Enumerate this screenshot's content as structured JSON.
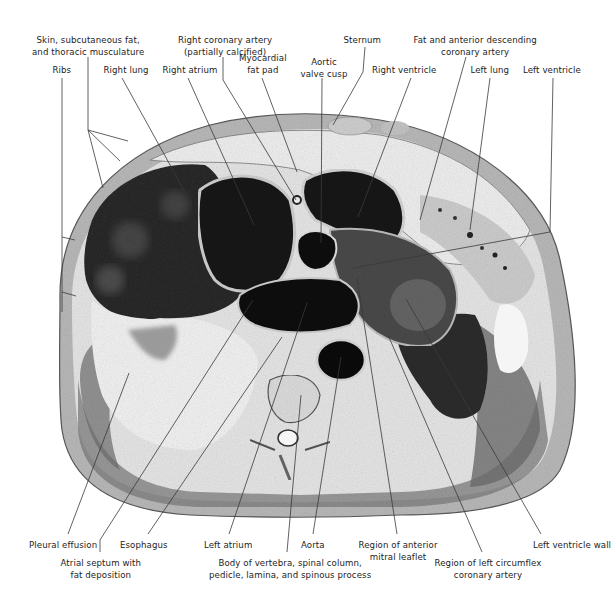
{
  "figure": {
    "type": "anatomical cross-section",
    "colors": {
      "ink": "#1d1d1d",
      "tissue_dark": "#141414",
      "tissue_mid": "#6d6d6d",
      "tissue_light": "#d9d9d9",
      "background": "#ffffff"
    }
  },
  "labels": {
    "top": [
      {
        "id": "skin",
        "lines": [
          "Skin, subcutaneous fat,",
          "and thoracic musculature"
        ],
        "x": 88,
        "y": 35
      },
      {
        "id": "right-coronary",
        "lines": [
          "Right coronary artery",
          "(partially calcified)"
        ],
        "x": 225,
        "y": 35
      },
      {
        "id": "sternum",
        "lines": [
          "Sternum"
        ],
        "x": 362,
        "y": 35
      },
      {
        "id": "fat-lad",
        "lines": [
          "Fat and anterior descending",
          "coronary artery"
        ],
        "x": 475,
        "y": 35
      },
      {
        "id": "myocardial-fat",
        "lines": [
          "Myocardial",
          "fat pad"
        ],
        "x": 263,
        "y": 53
      },
      {
        "id": "aortic-valve",
        "lines": [
          "Aortic",
          "valve cusp"
        ],
        "x": 324,
        "y": 57
      },
      {
        "id": "ribs",
        "lines": [
          "Ribs"
        ],
        "x": 62,
        "y": 65
      },
      {
        "id": "right-lung",
        "lines": [
          "Right lung"
        ],
        "x": 126,
        "y": 65
      },
      {
        "id": "right-atrium",
        "lines": [
          "Right atrium"
        ],
        "x": 190,
        "y": 65
      },
      {
        "id": "right-ventricle",
        "lines": [
          "Right ventricle"
        ],
        "x": 404,
        "y": 65
      },
      {
        "id": "left-lung",
        "lines": [
          "Left lung"
        ],
        "x": 490,
        "y": 65
      },
      {
        "id": "left-ventricle",
        "lines": [
          "Left ventricle"
        ],
        "x": 552,
        "y": 65
      }
    ],
    "bottom": [
      {
        "id": "pleural-effusion",
        "lines": [
          "Pleural effusion"
        ],
        "x": 63,
        "y": 540
      },
      {
        "id": "esophagus",
        "lines": [
          "Esophagus"
        ],
        "x": 144,
        "y": 540
      },
      {
        "id": "left-atrium",
        "lines": [
          "Left atrium"
        ],
        "x": 228,
        "y": 540
      },
      {
        "id": "aorta",
        "lines": [
          "Aorta"
        ],
        "x": 313,
        "y": 540
      },
      {
        "id": "anterior-mitral",
        "lines": [
          "Region of anterior",
          "mitral leaflet"
        ],
        "x": 398,
        "y": 540
      },
      {
        "id": "lv-wall",
        "lines": [
          "Left ventricle wall"
        ],
        "x": 572,
        "y": 540
      },
      {
        "id": "atrial-septum",
        "lines": [
          "Atrial septum with",
          "fat deposition"
        ],
        "x": 101,
        "y": 558
      },
      {
        "id": "vertebra",
        "lines": [
          "Body of vertebra, spinal column,",
          "pedicle, lamina, and spinous process"
        ],
        "x": 290,
        "y": 558
      },
      {
        "id": "circumflex",
        "lines": [
          "Region of left circumflex",
          "coronary artery"
        ],
        "x": 488,
        "y": 558
      }
    ]
  },
  "leaders": [
    {
      "to": "ribs",
      "pts": [
        [
          62,
          78
        ],
        [
          62,
          312
        ]
      ]
    },
    {
      "to": "ribs-tick-1",
      "pts": [
        [
          62,
          237
        ],
        [
          75,
          240
        ]
      ]
    },
    {
      "to": "ribs-tick-2",
      "pts": [
        [
          62,
          292
        ],
        [
          76,
          296
        ]
      ]
    },
    {
      "to": "skin",
      "pts": [
        [
          88,
          57
        ],
        [
          88,
          130
        ],
        [
          128,
          141
        ]
      ]
    },
    {
      "to": "skin-2",
      "pts": [
        [
          88,
          130
        ],
        [
          120,
          161
        ]
      ]
    },
    {
      "to": "skin-3",
      "pts": [
        [
          88,
          130
        ],
        [
          103,
          188
        ]
      ]
    },
    {
      "to": "right-lung",
      "pts": [
        [
          122,
          78
        ],
        [
          185,
          192
        ]
      ]
    },
    {
      "to": "right-atrium",
      "pts": [
        [
          188,
          78
        ],
        [
          254,
          225
        ]
      ]
    },
    {
      "to": "right-coronary",
      "pts": [
        [
          223,
          57
        ],
        [
          223,
          80
        ],
        [
          296,
          200
        ]
      ]
    },
    {
      "to": "myocardial-fat",
      "pts": [
        [
          262,
          78
        ],
        [
          297,
          172
        ]
      ]
    },
    {
      "to": "aortic-valve",
      "pts": [
        [
          322,
          78
        ],
        [
          321,
          243
        ]
      ]
    },
    {
      "to": "sternum",
      "pts": [
        [
          365,
          47
        ],
        [
          363,
          72
        ],
        [
          333,
          125
        ]
      ]
    },
    {
      "to": "right-ventricle",
      "pts": [
        [
          411,
          78
        ],
        [
          358,
          217
        ]
      ]
    },
    {
      "to": "fat-lad",
      "pts": [
        [
          466,
          57
        ],
        [
          420,
          220
        ]
      ]
    },
    {
      "to": "left-lung",
      "pts": [
        [
          490,
          78
        ],
        [
          470,
          230
        ]
      ]
    },
    {
      "to": "left-ventricle",
      "pts": [
        [
          553,
          78
        ],
        [
          550,
          232
        ],
        [
          353,
          268
        ]
      ]
    },
    {
      "to": "pleural-effusion",
      "pts": [
        [
          68,
          534
        ],
        [
          129,
          373
        ]
      ]
    },
    {
      "to": "atrial-septum",
      "pts": [
        [
          100,
          552
        ],
        [
          100,
          540
        ],
        [
          253,
          300
        ]
      ]
    },
    {
      "to": "esophagus",
      "pts": [
        [
          148,
          534
        ],
        [
          282,
          337
        ]
      ]
    },
    {
      "to": "left-atrium",
      "pts": [
        [
          229,
          534
        ],
        [
          307,
          303
        ]
      ]
    },
    {
      "to": "vertebra",
      "pts": [
        [
          287,
          552
        ],
        [
          301,
          395
        ]
      ]
    },
    {
      "to": "aorta",
      "pts": [
        [
          313,
          534
        ],
        [
          341,
          357
        ]
      ]
    },
    {
      "to": "anterior-mitral",
      "pts": [
        [
          397,
          534
        ],
        [
          357,
          278
        ]
      ]
    },
    {
      "to": "circumflex",
      "pts": [
        [
          482,
          552
        ],
        [
          388,
          335
        ]
      ]
    },
    {
      "to": "lv-wall",
      "pts": [
        [
          541,
          534
        ],
        [
          406,
          299
        ]
      ]
    }
  ]
}
